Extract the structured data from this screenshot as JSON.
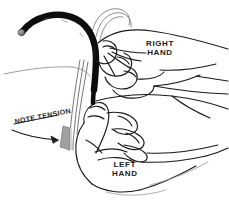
{
  "illustration": {
    "type": "line-drawing",
    "subject": "two hands demonstrating tube and suture tension technique",
    "background_color": "#ffffff",
    "line_color": "#1a1a1a",
    "shading_color": "#9a9a9a",
    "tube_color": "#0d0d0d"
  },
  "annotations": {
    "right_hand": {
      "line1": "RIGHT",
      "line2": "HAND"
    },
    "left_hand": {
      "line1": "LEFT",
      "line2": "HAND"
    },
    "note_tension": {
      "text": "NOTE TENSION"
    }
  },
  "elements": {
    "tube": "dark-curved-tube",
    "tube_tip": "tube-tip-highlight",
    "strands": "suture-strand-bundle",
    "tension_marker": "shaded-tension-wedge",
    "arrow": "tension-pointer-arrow",
    "right_hand": "right-hand-outline",
    "left_hand": "left-hand-outline",
    "forearm_upper": "upper-forearm-contour",
    "forearm_lower": "lower-forearm-contour"
  }
}
